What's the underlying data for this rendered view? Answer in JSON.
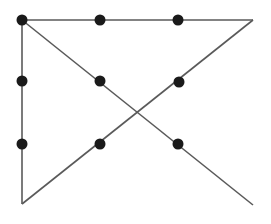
{
  "figure": {
    "background_color": "#ffffff",
    "line_color": "#5a5a5a",
    "node_color": "#1a1a1a",
    "node_radius": 5.5,
    "line_width": 1.6,
    "canvas": {
      "width": 271,
      "height": 224
    },
    "corners": [
      {
        "name": "top-left",
        "x": 22,
        "y": 20
      },
      {
        "name": "top-right",
        "x": 253,
        "y": 20
      },
      {
        "name": "bottom-left",
        "x": 22,
        "y": 204
      },
      {
        "name": "bottom-right",
        "x": 253,
        "y": 205
      }
    ],
    "edges": [
      {
        "name": "top-horizontal-edge",
        "x1": 22,
        "y1": 20,
        "x2": 253,
        "y2": 20
      },
      {
        "name": "left-vertical-edge",
        "x1": 22,
        "y1": 20,
        "x2": 22,
        "y2": 204
      },
      {
        "name": "descending-diagonal-edge",
        "x1": 22,
        "y1": 20,
        "x2": 253,
        "y2": 205
      },
      {
        "name": "ascending-diagonal-edge",
        "x1": 22,
        "y1": 204,
        "x2": 253,
        "y2": 20
      }
    ],
    "nodes": [
      {
        "name": "node-top-left",
        "x": 22,
        "y": 20
      },
      {
        "name": "node-top-middle",
        "x": 100,
        "y": 20
      },
      {
        "name": "node-top-right-inner",
        "x": 178,
        "y": 20
      },
      {
        "name": "node-left-upper",
        "x": 22,
        "y": 81
      },
      {
        "name": "node-center-upper-left",
        "x": 100,
        "y": 81
      },
      {
        "name": "node-center-upper-right",
        "x": 179,
        "y": 82
      },
      {
        "name": "node-left-lower",
        "x": 22,
        "y": 144
      },
      {
        "name": "node-center-lower-left",
        "x": 100,
        "y": 144
      },
      {
        "name": "node-center-lower-right",
        "x": 178,
        "y": 144
      }
    ],
    "intersection": {
      "name": "diagonal-crossing",
      "x": 138,
      "y": 113
    }
  }
}
